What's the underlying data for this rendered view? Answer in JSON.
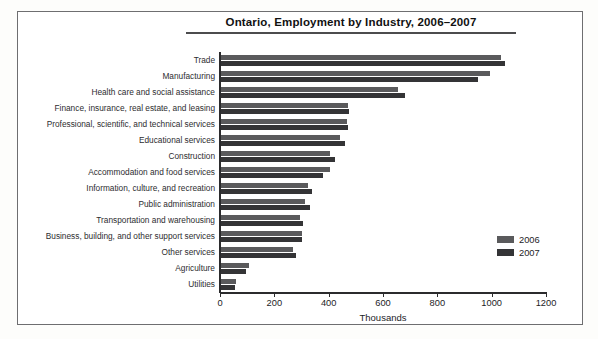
{
  "chart_data": {
    "type": "bar",
    "orientation": "horizontal",
    "title": "Ontario, Employment by Industry, 2006–2007",
    "xlabel": "Thousands",
    "ylabel": "",
    "xlim": [
      0,
      1200
    ],
    "xticks": [
      0,
      200,
      400,
      600,
      800,
      1000,
      1200
    ],
    "grid": false,
    "legend_position": "middle-right",
    "categories": [
      "Trade",
      "Manufacturing",
      "Health care and social assistance",
      "Finance, insurance, real estate, and leasing",
      "Professional, scientific, and technical services",
      "Educational services",
      "Construction",
      "Accommodation and food services",
      "Information, culture, and recreation",
      "Public administration",
      "Transportation and warehousing",
      "Business, building, and other support services",
      "Other services",
      "Agriculture",
      "Utilities"
    ],
    "series": [
      {
        "name": "2006",
        "color": "#5a5a5c",
        "values": [
          1033,
          995,
          655,
          470,
          468,
          440,
          405,
          405,
          325,
          312,
          295,
          300,
          270,
          105,
          58
        ]
      },
      {
        "name": "2007",
        "color": "#343436",
        "values": [
          1048,
          950,
          680,
          475,
          472,
          460,
          425,
          378,
          340,
          330,
          305,
          300,
          280,
          95,
          55
        ]
      }
    ]
  },
  "legend": {
    "entries": [
      {
        "label": "2006"
      },
      {
        "label": "2007"
      }
    ]
  }
}
